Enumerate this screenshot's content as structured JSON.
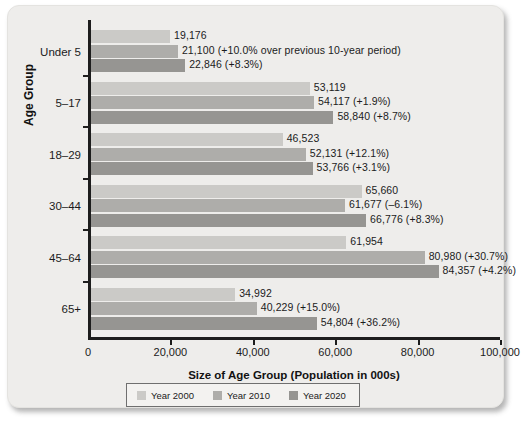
{
  "chart_data": {
    "type": "bar",
    "orientation": "horizontal",
    "title": "",
    "xlabel": "Size of Age Group (Population in 000s)",
    "ylabel": "Age Group",
    "xlim": [
      0,
      100000
    ],
    "xticks": [
      "0",
      "20,000",
      "40,000",
      "60,000",
      "80,000",
      "100,000"
    ],
    "xtick_values": [
      0,
      20000,
      40000,
      60000,
      80000,
      100000
    ],
    "grid": false,
    "legend_position": "bottom",
    "categories": [
      "Under 5",
      "5–17",
      "18–29",
      "30–44",
      "45–64",
      "65+"
    ],
    "series": [
      {
        "name": "Year 2000",
        "color": "#cbcac7",
        "values": [
          19176,
          53119,
          46523,
          65660,
          61954,
          34992
        ],
        "labels": [
          "19,176",
          "53,119",
          "46,523",
          "65,660",
          "61,954",
          "34,992"
        ]
      },
      {
        "name": "Year 2010",
        "color": "#aeadaa",
        "values": [
          21100,
          54117,
          52131,
          61677,
          80980,
          40229
        ],
        "labels": [
          "21,100 (+10.0% over previous 10-year period)",
          "54,117 (+1.9%)",
          "52,131 (+12.1%)",
          "61,677 (–6.1%)",
          "80,980 (+30.7%)",
          "40,229 (+15.0%)"
        ]
      },
      {
        "name": "Year 2020",
        "color": "#969592",
        "values": [
          22846,
          58840,
          53766,
          66776,
          84357,
          54804
        ],
        "labels": [
          "22,846 (+8.3%)",
          "58,840 (+8.7%)",
          "53,766 (+3.1%)",
          "66,776 (+8.3%)",
          "84,357 (+4.2%)",
          "54,804 (+36.2%)"
        ]
      }
    ]
  },
  "legend": {
    "items": [
      {
        "label": "Year 2000"
      },
      {
        "label": "Year 2010"
      },
      {
        "label": "Year 2020"
      }
    ]
  },
  "axes": {
    "x_title": "Size of Age Group (Population in 000s)",
    "y_title": "Age Group"
  }
}
